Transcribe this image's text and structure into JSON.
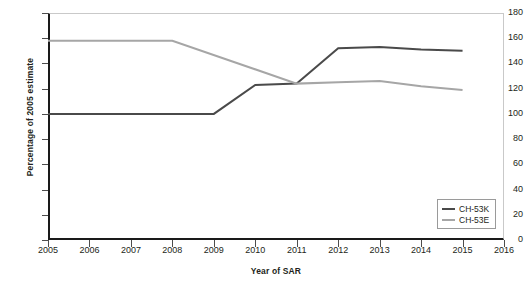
{
  "chart_data": {
    "type": "line",
    "title": "",
    "xlabel": "Year of SAR",
    "ylabel": "Percentage of 2005 estimate",
    "xlim": [
      2005,
      2016
    ],
    "ylim": [
      0,
      180
    ],
    "ytick_step": 20,
    "grid": false,
    "legend_position": "bottom-right",
    "categories": [
      2005,
      2006,
      2007,
      2008,
      2009,
      2010,
      2011,
      2012,
      2013,
      2014,
      2015,
      2016
    ],
    "xticks": [
      "2005",
      "2006",
      "2007",
      "2008",
      "2009",
      "2010",
      "2011",
      "2012",
      "2013",
      "2014",
      "2015",
      "2016"
    ],
    "yticks": [
      "0",
      "20",
      "40",
      "60",
      "80",
      "100",
      "120",
      "140",
      "160",
      "180"
    ],
    "series": [
      {
        "name": "CH-53K",
        "color": "#4a4a4a",
        "x": [
          2005,
          2006,
          2007,
          2008,
          2009,
          2010,
          2011,
          2012,
          2013,
          2014,
          2015
        ],
        "values": [
          100,
          100,
          100,
          100,
          100,
          123,
          124,
          152,
          153,
          151,
          150
        ]
      },
      {
        "name": "CH-53E",
        "color": "#a6a6a6",
        "x": [
          2005,
          2006,
          2007,
          2008,
          2011,
          2012,
          2013,
          2014,
          2015
        ],
        "values": [
          158,
          158,
          158,
          158,
          124,
          125,
          126,
          122,
          119
        ]
      }
    ]
  },
  "legend": {
    "entries": [
      {
        "label": "CH-53K",
        "color": "#4a4a4a"
      },
      {
        "label": "CH-53E",
        "color": "#a6a6a6"
      }
    ]
  },
  "axes": {
    "x_title": "Year of SAR",
    "y_title": "Percentage of 2005 estimate"
  },
  "colors": {
    "series_dark": "#4a4a4a",
    "series_light": "#a6a6a6",
    "axis": "#1a1a1a",
    "frame": "#c9c9c9",
    "text": "#231f20"
  }
}
